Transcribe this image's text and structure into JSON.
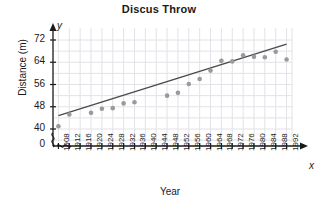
{
  "chart_data": {
    "type": "scatter",
    "title": "Discus Throw",
    "xlabel": "Year",
    "ylabel": "Distance (m)",
    "x_axis_letter": "x",
    "y_axis_letter": "y",
    "grid": true,
    "legend": "none",
    "axis_break": true,
    "origin_label": "0",
    "xlim": [
      1906,
      1994
    ],
    "ylim": [
      38,
      75
    ],
    "yticks": [
      40,
      48,
      56,
      64,
      72
    ],
    "xticks": [
      1908,
      1912,
      1916,
      1920,
      1924,
      1928,
      1932,
      1936,
      1940,
      1944,
      1948,
      1952,
      1956,
      1960,
      1964,
      1968,
      1972,
      1976,
      1980,
      1984,
      1988,
      1992
    ],
    "point_color": "#9a9a9a",
    "line_color": "#4a4a4a",
    "grid_color": "#e2e2e8",
    "axis_color": "#1a1a1a",
    "points": [
      {
        "x": 1908,
        "y": 41.0
      },
      {
        "x": 1912,
        "y": 45.2
      },
      {
        "x": 1920,
        "y": 45.8
      },
      {
        "x": 1924,
        "y": 47.3
      },
      {
        "x": 1928,
        "y": 47.5
      },
      {
        "x": 1932,
        "y": 49.2
      },
      {
        "x": 1936,
        "y": 49.6
      },
      {
        "x": 1948,
        "y": 52.0
      },
      {
        "x": 1952,
        "y": 53.0
      },
      {
        "x": 1956,
        "y": 56.2
      },
      {
        "x": 1960,
        "y": 58.0
      },
      {
        "x": 1964,
        "y": 61.0
      },
      {
        "x": 1968,
        "y": 64.5
      },
      {
        "x": 1972,
        "y": 64.3
      },
      {
        "x": 1976,
        "y": 66.5
      },
      {
        "x": 1980,
        "y": 66.0
      },
      {
        "x": 1984,
        "y": 65.8
      },
      {
        "x": 1988,
        "y": 67.8
      },
      {
        "x": 1992,
        "y": 65.0
      }
    ],
    "trend_line": {
      "x1": 1908,
      "y1": 44.8,
      "x2": 1992,
      "y2": 70.5
    }
  }
}
